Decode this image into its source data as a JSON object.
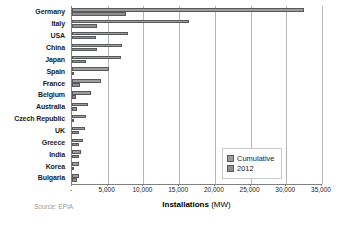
{
  "chart_data": {
    "type": "bar",
    "orientation": "horizontal",
    "title": "",
    "xlabel_bold": "Installations",
    "xlabel_unit": "(MW)",
    "ylabel": "",
    "xlim": [
      0,
      35000
    ],
    "xticks": [
      0,
      5000,
      10000,
      15000,
      20000,
      25000,
      30000,
      35000
    ],
    "xtick_labels": [
      "-",
      "5,000",
      "10,000",
      "15,000",
      "20,000",
      "25,000",
      "30,000",
      "35,000"
    ],
    "grid": true,
    "grid_axis": "x",
    "legend_position": "center-right",
    "categories": [
      "Germany",
      "Italy",
      "USA",
      "China",
      "Japan",
      "Spain",
      "France",
      "Belgium",
      "Australia",
      "Czech Republic",
      "UK",
      "Greece",
      "India",
      "Korea",
      "Bulgaria"
    ],
    "series": [
      {
        "name": "Cumulative",
        "color": "#9c9c9c",
        "values": [
          32411,
          16361,
          7777,
          7000,
          6914,
          5166,
          4003,
          2650,
          2291,
          2022,
          1829,
          1536,
          1205,
          1024,
          1012
        ]
      },
      {
        "name": "2012",
        "color": "#8f8f8f",
        "values": [
          7604,
          3438,
          3313,
          3500,
          2000,
          276,
          1079,
          599,
          700,
          113,
          925,
          912,
          980,
          240,
          767
        ]
      }
    ],
    "annotations": {
      "source": "Source: EPIA"
    }
  },
  "legend": {
    "items": [
      {
        "label": "Cumulative"
      },
      {
        "label": "2012"
      }
    ]
  }
}
